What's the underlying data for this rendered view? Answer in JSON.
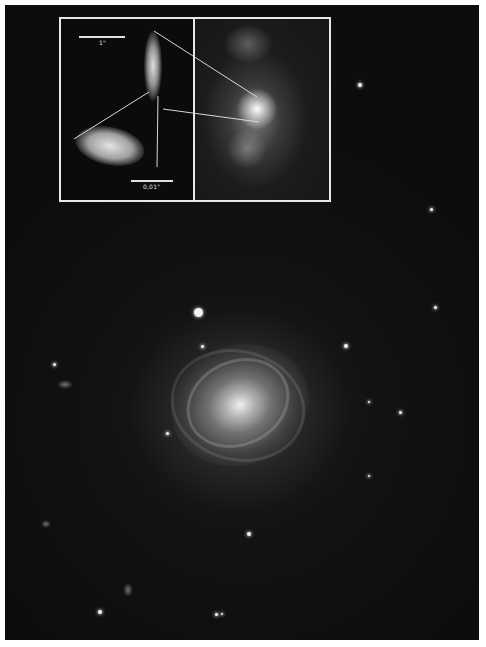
{
  "figure": {
    "background_color": "#0d0d0d",
    "frame_color": "#e8e8e8"
  },
  "inset": {
    "left_panel": {
      "scale_bar_top_label": "1\"",
      "scale_bar_bottom_label": "0,01\""
    },
    "right_panel": {
      "description": "nebular star-forming region"
    }
  },
  "main": {
    "galaxy": "face-on spiral galaxy",
    "foreground_star": "bright star above galaxy"
  }
}
